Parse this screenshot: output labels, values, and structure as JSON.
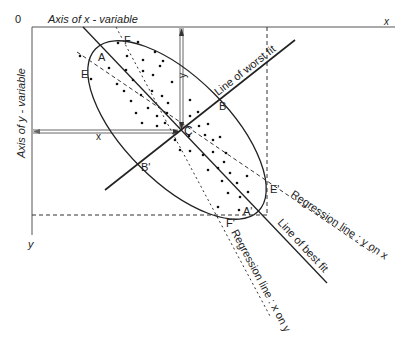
{
  "diagram": {
    "origin_label": "0",
    "x_axis_title": "Axis of x - variable",
    "y_axis_title": "Axis of y - variable",
    "x_axis_end": "x",
    "y_axis_end": "y",
    "x_distance_label": "x",
    "y_distance_label": "y",
    "points": {
      "A": "A",
      "A_prime": "A'",
      "B": "B",
      "B_prime": "B'",
      "C": "C",
      "E": "E",
      "E_prime": "E'",
      "F": "F",
      "F_prime": "F'"
    },
    "lines": {
      "best_fit": "Line of best fit",
      "worst_fit": "Line of worst fit",
      "reg_y_on_x": "Regression line : y on x",
      "reg_x_on_y": "Regression line : x on y"
    },
    "colors": {
      "line": "#222222",
      "axis": "#555555",
      "dots": "#111111"
    }
  }
}
